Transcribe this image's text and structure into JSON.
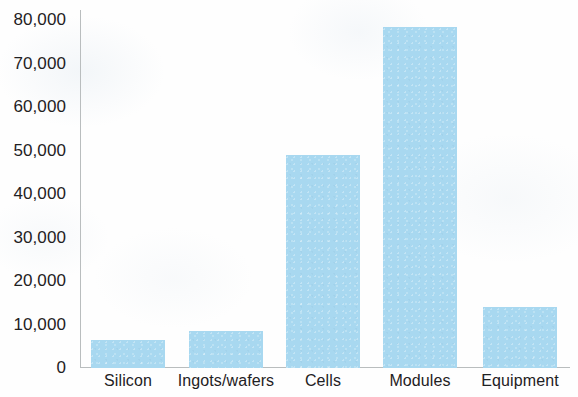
{
  "chart_data": {
    "type": "bar",
    "title": "",
    "subtitle": "",
    "xlabel": "",
    "ylabel": "",
    "categories": [
      "Silicon",
      "Ingots/wafers",
      "Cells",
      "Modules",
      "Equipment"
    ],
    "values": [
      6500,
      8500,
      49000,
      78500,
      14000
    ],
    "ylim": [
      0,
      80000
    ],
    "ytick_values": [
      0,
      10000,
      20000,
      30000,
      40000,
      50000,
      60000,
      70000,
      80000
    ],
    "ytick_labels": [
      "0",
      "10,000",
      "20,000",
      "30,000",
      "40,000",
      "50,000",
      "60,000",
      "70,000",
      "80,000"
    ],
    "grid": false,
    "legend": null,
    "bar_color": "#a8d8f0",
    "axis_color": "#b9bdbe",
    "text_color": "#1f2123",
    "background": "#fefefe",
    "bars": [
      {
        "category": "Silicon",
        "value": 6500,
        "x_center": 128
      },
      {
        "category": "Ingots/wafers",
        "value": 8500,
        "x_center": 226
      },
      {
        "category": "Cells",
        "value": 49000,
        "x_center": 323
      },
      {
        "category": "Modules",
        "value": 78500,
        "x_center": 420
      },
      {
        "category": "Equipment",
        "value": 14000,
        "x_center": 520
      }
    ]
  }
}
